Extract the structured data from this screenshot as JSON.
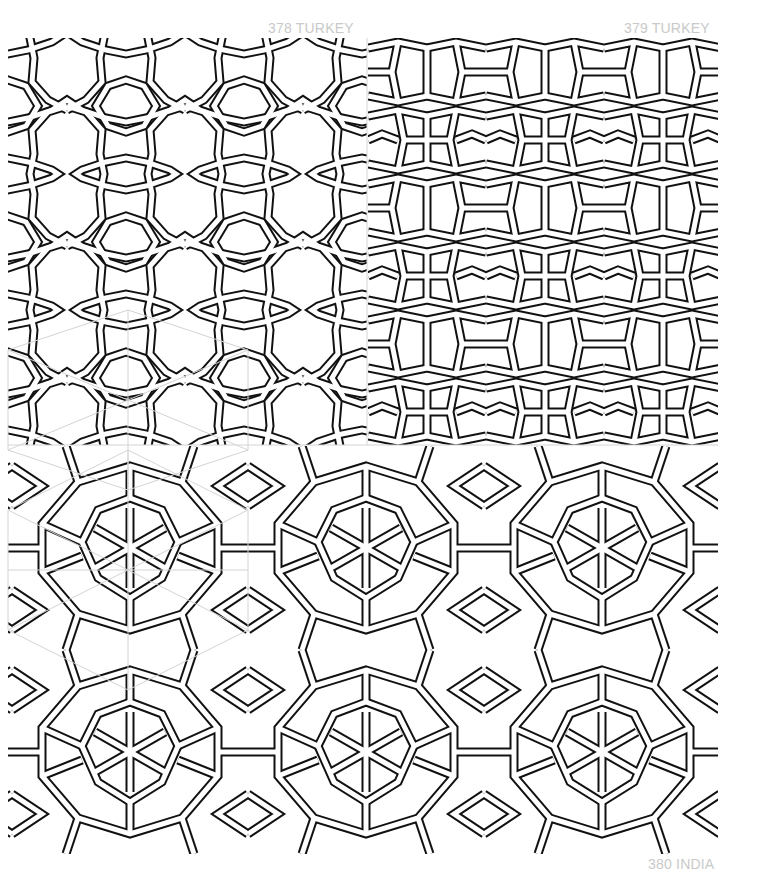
{
  "page": {
    "background": "#ffffff",
    "line_color": "#111111",
    "guide_color": "#d4d4d4",
    "caption_color": "#c9c9c9"
  },
  "patterns": [
    {
      "number": "378",
      "origin": "TURKEY",
      "caption": "378 TURKEY",
      "position": "top-left"
    },
    {
      "number": "379",
      "origin": "TURKEY",
      "caption": "379 TURKEY",
      "position": "top-right"
    },
    {
      "number": "380",
      "origin": "INDIA",
      "caption": "380 INDIA",
      "position": "bottom"
    }
  ]
}
